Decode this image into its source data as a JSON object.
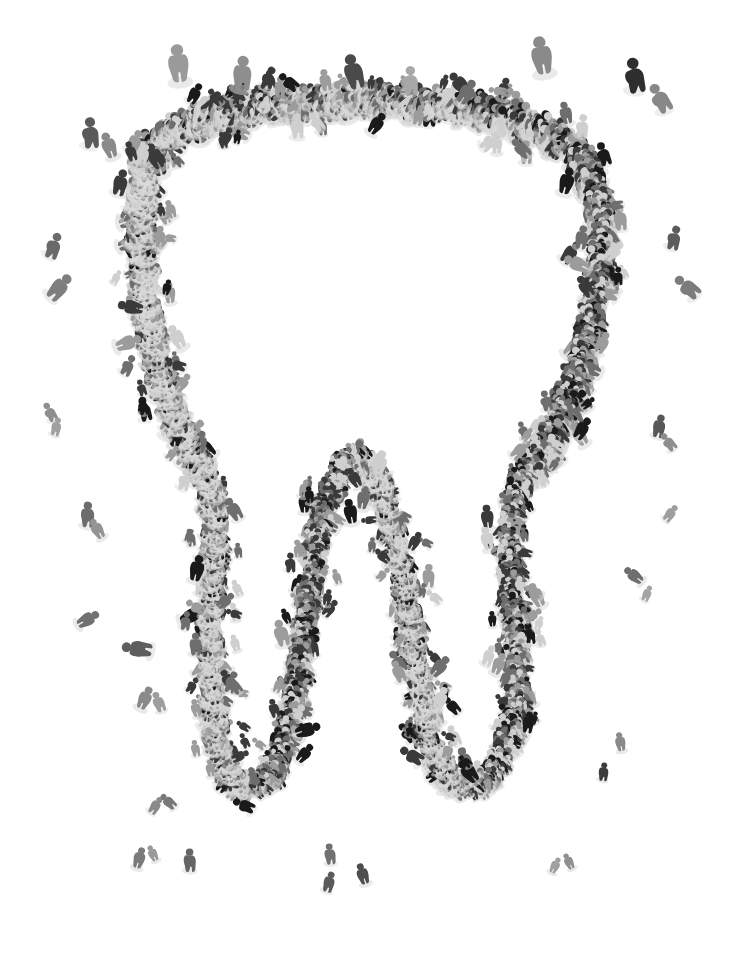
{
  "image": {
    "domain": "Natural-Image",
    "title": "Crowd forming a tooth",
    "subject": "molar-tooth",
    "description": "A very large crowd of people photographed from directly above, arranged so their bodies trace the outline of a molar tooth. Isolated individuals are scattered across the empty white field around the shape.",
    "medium": "aerial-photograph-composite",
    "background_color": "#ffffff",
    "canvas": {
      "width": 735,
      "height": 955
    },
    "orientation": "portrait",
    "color_mode": "grayscale",
    "people_count_label": "crowd",
    "figure_view": "top-down"
  },
  "palette": {
    "background": "#ffffff",
    "figure_darkest": "#1a1a1a",
    "figure_dark": "#3a3a3a",
    "figure_mid": "#6e6e6e",
    "figure_light": "#9c9c9c",
    "figure_lightest": "#cfcfcf",
    "shadow": "#d8d8d8"
  },
  "subject_shape": {
    "name": "molar-tooth-outline",
    "parts": [
      {
        "name": "crown-top-edge",
        "label": "Crown top",
        "y_range": [
          95,
          165
        ]
      },
      {
        "name": "crown-left-shoulder",
        "label": "Left shoulder",
        "x_range": [
          105,
          175
        ]
      },
      {
        "name": "crown-right-shoulder",
        "label": "Right shoulder",
        "x_range": [
          560,
          625
        ]
      },
      {
        "name": "left-root",
        "label": "Left root",
        "x_range": [
          165,
          300
        ]
      },
      {
        "name": "center-root-peak",
        "label": "Center root peak",
        "x_range": [
          300,
          440
        ]
      },
      {
        "name": "right-root",
        "label": "Right root",
        "x_range": [
          440,
          575
        ]
      }
    ],
    "outline_path": "M 148 152 C 170 124, 214 110, 262 104 C 318 96, 392 96, 452 104 C 508 112, 556 128, 578 152 C 600 178, 604 222, 600 268 C 594 326, 578 384, 556 424 C 540 452, 526 470, 516 492 C 506 520, 510 560, 514 602 C 518 650, 520 700, 508 738 C 498 772, 478 790, 458 782 C 440 774, 430 748, 424 712 C 416 664, 410 604, 400 560 C 392 520, 382 486, 370 468 C 358 452, 346 456, 336 476 C 324 500, 316 540, 310 584 C 302 640, 296 700, 286 738 C 276 776, 258 792, 242 784 C 226 776, 218 750, 214 712 C 208 660, 212 604, 214 556 C 216 516, 214 490, 204 468 C 192 442, 172 414, 160 374 C 148 332, 142 280, 142 232 C 142 196, 142 170, 148 152 Z",
    "stroke_band_width": 26
  },
  "crowd_density": {
    "crown_top": "dense",
    "crown_sides": "dense",
    "roots": "medium",
    "root_tips": "medium",
    "outliers": "sparse"
  },
  "outlier_figures": [
    {
      "x": 92,
      "y": 130,
      "scale": 1.4,
      "tone": "#5a5a5a",
      "rot": 12
    },
    {
      "x": 108,
      "y": 143,
      "scale": 1.1,
      "tone": "#8a8a8a",
      "rot": -20
    },
    {
      "x": 56,
      "y": 244,
      "scale": 1.2,
      "tone": "#6a6a6a",
      "rot": 35
    },
    {
      "x": 62,
      "y": 285,
      "scale": 1.3,
      "tone": "#7e7e7e",
      "rot": 48
    },
    {
      "x": 50,
      "y": 410,
      "scale": 0.9,
      "tone": "#8e8e8e",
      "rot": -12
    },
    {
      "x": 57,
      "y": 425,
      "scale": 0.8,
      "tone": "#a0a0a0",
      "rot": 20
    },
    {
      "x": 88,
      "y": 512,
      "scale": 1.1,
      "tone": "#6c6c6c",
      "rot": 8
    },
    {
      "x": 96,
      "y": 527,
      "scale": 0.9,
      "tone": "#949494",
      "rot": -30
    },
    {
      "x": 90,
      "y": 618,
      "scale": 1.0,
      "tone": "#707070",
      "rot": 60
    },
    {
      "x": 134,
      "y": 648,
      "scale": 1.3,
      "tone": "#5e5e5e",
      "rot": -75
    },
    {
      "x": 146,
      "y": 696,
      "scale": 1.0,
      "tone": "#8a8a8a",
      "rot": 25
    },
    {
      "x": 158,
      "y": 700,
      "scale": 0.9,
      "tone": "#9e9e9e",
      "rot": -15
    },
    {
      "x": 157,
      "y": 804,
      "scale": 0.8,
      "tone": "#8a8a8a",
      "rot": 40
    },
    {
      "x": 167,
      "y": 800,
      "scale": 0.8,
      "tone": "#787878",
      "rot": -40
    },
    {
      "x": 140,
      "y": 856,
      "scale": 0.9,
      "tone": "#7a7a7a",
      "rot": 16
    },
    {
      "x": 152,
      "y": 852,
      "scale": 0.7,
      "tone": "#9a9a9a",
      "rot": -25
    },
    {
      "x": 190,
      "y": 858,
      "scale": 1.0,
      "tone": "#666666",
      "rot": 5
    },
    {
      "x": 330,
      "y": 852,
      "scale": 0.9,
      "tone": "#707070",
      "rot": 0
    },
    {
      "x": 330,
      "y": 880,
      "scale": 0.9,
      "tone": "#5a5a5a",
      "rot": 22
    },
    {
      "x": 362,
      "y": 872,
      "scale": 0.9,
      "tone": "#4e4e4e",
      "rot": -18
    },
    {
      "x": 178,
      "y": 60,
      "scale": 1.6,
      "tone": "#9a9a9a",
      "rot": -6
    },
    {
      "x": 243,
      "y": 70,
      "scale": 1.5,
      "tone": "#8e8e8e",
      "rot": 10
    },
    {
      "x": 353,
      "y": 68,
      "scale": 1.5,
      "tone": "#4a4a4a",
      "rot": -8
    },
    {
      "x": 412,
      "y": 78,
      "scale": 1.3,
      "tone": "#a8a8a8",
      "rot": 14
    },
    {
      "x": 541,
      "y": 52,
      "scale": 1.6,
      "tone": "#8a8a8a",
      "rot": -10
    },
    {
      "x": 636,
      "y": 72,
      "scale": 1.6,
      "tone": "#2e2e2e",
      "rot": 6
    },
    {
      "x": 660,
      "y": 95,
      "scale": 1.4,
      "tone": "#888888",
      "rot": -14
    },
    {
      "x": 676,
      "y": 236,
      "scale": 1.1,
      "tone": "#5c5c5c",
      "rot": 28
    },
    {
      "x": 686,
      "y": 284,
      "scale": 1.3,
      "tone": "#7c7c7c",
      "rot": -34
    },
    {
      "x": 660,
      "y": 424,
      "scale": 1.0,
      "tone": "#585858",
      "rot": 18
    },
    {
      "x": 668,
      "y": 440,
      "scale": 0.9,
      "tone": "#8e8e8e",
      "rot": -22
    },
    {
      "x": 672,
      "y": 512,
      "scale": 0.8,
      "tone": "#9e9e9e",
      "rot": 44
    },
    {
      "x": 632,
      "y": 574,
      "scale": 0.9,
      "tone": "#6e6e6e",
      "rot": -52
    },
    {
      "x": 648,
      "y": 592,
      "scale": 0.7,
      "tone": "#a4a4a4",
      "rot": 30
    },
    {
      "x": 620,
      "y": 740,
      "scale": 0.8,
      "tone": "#8a8a8a",
      "rot": -10
    },
    {
      "x": 604,
      "y": 770,
      "scale": 0.8,
      "tone": "#3c3c3c",
      "rot": 12
    },
    {
      "x": 556,
      "y": 864,
      "scale": 0.7,
      "tone": "#a0a0a0",
      "rot": 26
    },
    {
      "x": 568,
      "y": 860,
      "scale": 0.7,
      "tone": "#909090",
      "rot": -26
    }
  ],
  "meta_labels": {
    "stage_label": "Artwork canvas",
    "shape_label": "Tooth silhouette formed by crowd",
    "outliers_label": "Scattered individual figures",
    "caption": "Aerial view of a crowd of people arranged in the shape of a molar tooth on a white background."
  }
}
